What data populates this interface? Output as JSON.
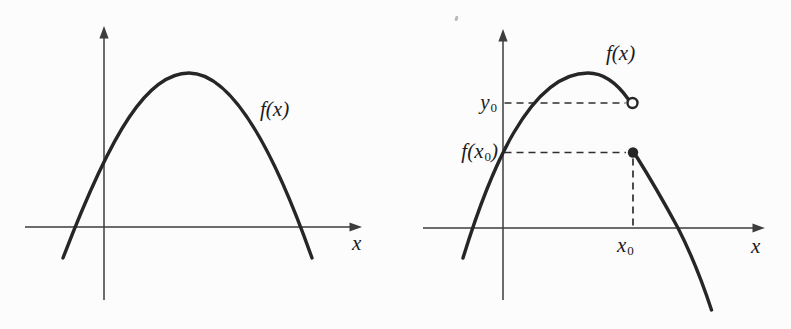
{
  "figure": {
    "left_panel": {
      "curve_label": "f(x)",
      "x_axis_label": "x"
    },
    "right_panel": {
      "curve_label": "f(x)",
      "x_axis_label": "x",
      "y0_label": {
        "base": "y",
        "sub": "0"
      },
      "fx0_label": {
        "pre": "f(x",
        "sub": "0",
        "post": ")"
      },
      "x0_label": {
        "base": "x",
        "sub": "0"
      }
    },
    "colors": {
      "ink": "#262626",
      "axis": "#3d3d3d",
      "dash": "#2e2e2e",
      "background": "#fcfcfc"
    }
  }
}
